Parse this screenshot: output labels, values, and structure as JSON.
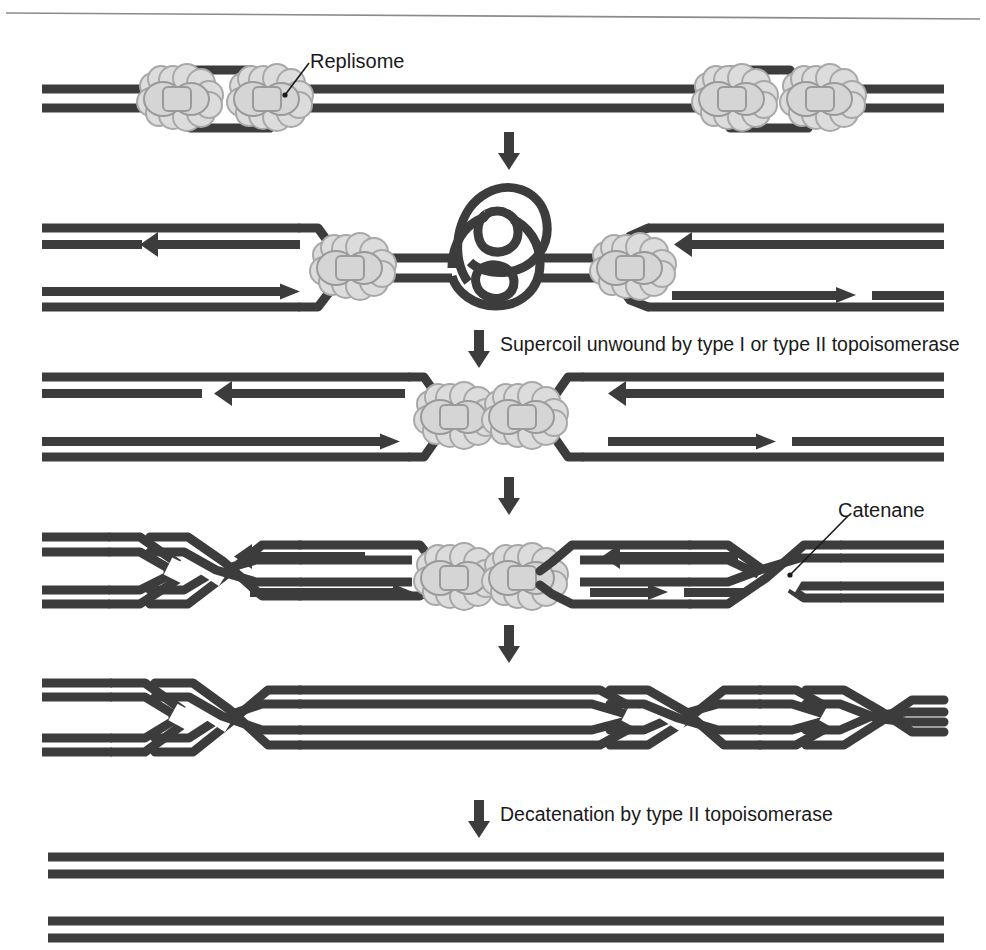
{
  "figure": {
    "background_color": "#ffffff",
    "dna_color": "#3c3c3c",
    "replisome_fill": "#dcdcdc",
    "replisome_outline": "#a8a8a8",
    "text_color": "#1a1a1a",
    "rule_color": "#8a8a8a"
  },
  "labels": {
    "replisome": "Replisome",
    "catenane": "Catenane"
  },
  "steps": [
    {
      "id": "step-1",
      "index": 1,
      "caption": "",
      "description": "Replication bubble with two replisomes on parental duplex"
    },
    {
      "id": "step-2",
      "index": 2,
      "caption": "",
      "description": "Converging forks create a positive supercoil between them"
    },
    {
      "id": "step-3",
      "index": 3,
      "caption": "Supercoil unwound by type I or type II topoisomerase",
      "description": "Supercoil removed; replisomes meet"
    },
    {
      "id": "step-4",
      "index": 4,
      "caption": "",
      "description": "Interlinked daughter duplexes form catenanes"
    },
    {
      "id": "step-5",
      "index": 5,
      "caption": "",
      "description": "Fully catenated daughter molecules"
    },
    {
      "id": "step-6",
      "index": 6,
      "caption": "Decatenation by type II topoisomerase",
      "description": "Two separated daughter duplexes"
    }
  ],
  "step_captions": {
    "supercoil": "Supercoil unwound by type I or type II topoisomerase",
    "decatenation": "Decatenation by type II topoisomerase"
  },
  "arrows": {
    "down_arrow_1": "down-arrow",
    "down_arrow_2": "down-arrow",
    "down_arrow_3": "down-arrow",
    "down_arrow_4": "down-arrow",
    "down_arrow_5": "down-arrow",
    "strand_direction_left_lagging": "left",
    "strand_direction_left_leading": "right",
    "strand_direction_right_lagging": "left",
    "strand_direction_right_leading": "right"
  }
}
